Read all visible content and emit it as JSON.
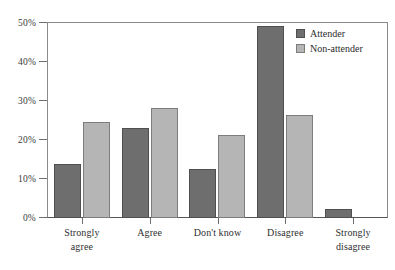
{
  "chart_data": {
    "type": "bar",
    "title": "",
    "xlabel": "",
    "ylabel": "",
    "categories": [
      "Strongly agree",
      "Agree",
      "Don't know",
      "Disagree",
      "Strongly disagree"
    ],
    "category_lines": [
      [
        "Strongly",
        "agree"
      ],
      [
        "Agree"
      ],
      [
        "Don't know"
      ],
      [
        "Disagree"
      ],
      [
        "Strongly",
        "disagree"
      ]
    ],
    "series": [
      {
        "name": "Attender",
        "color": "#6e6e6e",
        "values": [
          13.8,
          23.2,
          12.5,
          49.2,
          2.3
        ]
      },
      {
        "name": "Non-attender",
        "color": "#b5b5b5",
        "values": [
          24.7,
          28.1,
          21.2,
          26.5,
          null
        ]
      }
    ],
    "ylim": [
      0,
      50
    ],
    "yticks": [
      0,
      10,
      20,
      30,
      40,
      50
    ],
    "ytick_labels": [
      "0%",
      "10%",
      "20%",
      "30%",
      "40%",
      "50%"
    ],
    "grid": false,
    "legend_position": "top-right"
  },
  "legend": {
    "entries": [
      {
        "label": "Attender"
      },
      {
        "label": "Non-attender"
      }
    ]
  }
}
